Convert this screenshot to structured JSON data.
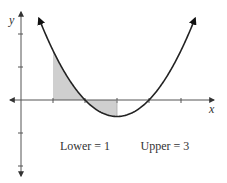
{
  "chart_data": {
    "type": "line",
    "title": "",
    "xlabel": "x",
    "ylabel": "y",
    "function": "y = 0.5(x - 2)(x - 4)",
    "x_ticks": [
      1,
      2,
      3,
      4,
      5
    ],
    "y_ticks": [
      2,
      1,
      -1,
      -2
    ],
    "tick_labels_shown": false,
    "xlim": [
      0,
      6
    ],
    "ylim": [
      -3,
      3
    ],
    "grid": false,
    "series": [
      {
        "name": "curve",
        "x": [
          0.56,
          1,
          1.5,
          2,
          2.5,
          3,
          3.5,
          4,
          4.5,
          5,
          5.44
        ],
        "y": [
          2.47,
          1.5,
          0.625,
          0,
          -0.375,
          -0.5,
          -0.375,
          0,
          0.625,
          1.5,
          2.47
        ]
      }
    ],
    "shaded_region": {
      "from_x": 1,
      "to_x": 3,
      "between": "curve and x-axis"
    },
    "annotations": [
      {
        "text": "Lower = 1",
        "anchor_x": 2
      },
      {
        "text": "Upper = 3",
        "anchor_x": 4.5
      }
    ],
    "colors": {
      "axis": "#555555",
      "curve": "#222222",
      "shade": "#cfcfcf",
      "text": "#333333"
    }
  }
}
